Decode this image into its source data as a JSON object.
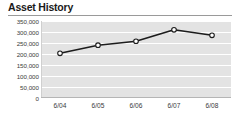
{
  "header": {
    "title": "Asset History"
  },
  "chart_data": {
    "type": "line",
    "title": "Asset History",
    "xlabel": "",
    "ylabel": "",
    "categories": [
      "6/04",
      "6/05",
      "6/06",
      "6/07",
      "6/08"
    ],
    "values": [
      203000,
      240000,
      258000,
      310000,
      285000
    ],
    "series": [
      {
        "name": "Assets",
        "values": [
          203000,
          240000,
          258000,
          310000,
          285000
        ]
      }
    ],
    "ylim": [
      0,
      350000
    ],
    "ytick_step": 50000,
    "ytick_labels": [
      "350,000",
      "300,000",
      "250,000",
      "200,000",
      "150,000",
      "100,000",
      "50,000",
      "0"
    ],
    "ytick_values": [
      350000,
      300000,
      250000,
      200000,
      150000,
      100000,
      50000,
      0
    ],
    "xtick_labels": [
      "6/04",
      "6/05",
      "6/06",
      "6/07",
      "6/08"
    ],
    "grid": true,
    "grid_style": "alternating-horizontal-bands",
    "legend": false,
    "legend_position": "none",
    "line_color": "#1c1c1c",
    "marker_shape": "circle",
    "marker_fill": "#ffffff",
    "marker_edge": "#1c1c1c",
    "plot_background": "#e3e3e3",
    "band_color": "#e3e3e3",
    "gridline_color": "#ffffff"
  },
  "colors": {
    "title_text": "#1a1a1a",
    "rule": "#9a9a9a",
    "axis_text": "#3a3a3a",
    "axis_line": "#b5b5b5",
    "line": "#1c1c1c",
    "marker_fill": "#ffffff",
    "plot_band": "#e3e3e3"
  }
}
